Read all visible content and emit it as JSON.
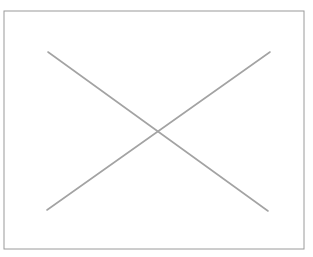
{
  "canvas": {
    "width": 313,
    "height": 257,
    "background_color": "#ffffff"
  },
  "graphic": {
    "name": "broken-image-placeholder",
    "description": "Empty rectangle frame crossed by two diagonal lines forming an X",
    "frame": {
      "x": 4,
      "y": 11,
      "width": 300,
      "height": 238,
      "stroke_color": "#9a9a9a",
      "stroke_width": 1,
      "fill_color": "#ffffff"
    },
    "cross": {
      "stroke_color": "#a3a3a3",
      "stroke_width": 1.6,
      "intersection": {
        "x": 158,
        "y": 131
      },
      "lines": [
        {
          "name": "diagonal-down",
          "x1": 48,
          "y1": 52,
          "x2": 268,
          "y2": 211
        },
        {
          "name": "diagonal-up",
          "x1": 47,
          "y1": 210,
          "x2": 270,
          "y2": 52
        }
      ]
    }
  }
}
